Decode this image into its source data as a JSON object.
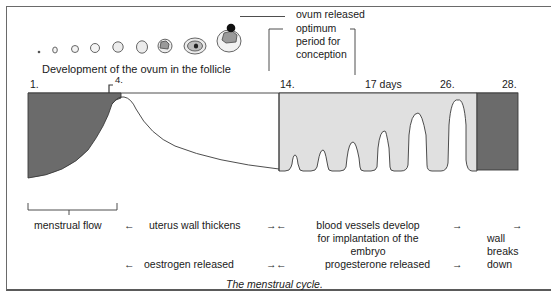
{
  "title": "The menstrual cycle.",
  "top": {
    "follicle_caption": "Development of the ovum in the follicle",
    "ovum_released": "ovum released",
    "conception_period": [
      "optimum",
      "period for",
      "conception"
    ]
  },
  "day_markers": [
    {
      "label": "1.",
      "day": 1
    },
    {
      "label": "4.",
      "day": 4
    },
    {
      "label": "14.",
      "day": 14
    },
    {
      "label": "17 days",
      "day": 17
    },
    {
      "label": "26.",
      "day": 26
    },
    {
      "label": "28.",
      "day": 28
    }
  ],
  "phases": {
    "menstrual_flow": "menstrual flow",
    "uterus_wall": "uterus wall thickens",
    "blood_vessels": [
      "blood vessels develop",
      "for implantation of the",
      "embryo"
    ],
    "wall_breaks": [
      "wall",
      "breaks",
      "down"
    ],
    "oestrogen": "oestrogen released",
    "progesterone": "progesterone released"
  },
  "arrows": {
    "left": "←",
    "right": "→"
  },
  "colors": {
    "dark_fill": "#6b6b6b",
    "light_fill": "#e0e0e0",
    "line": "#3a3a3a",
    "frame": "#6a6a6a"
  }
}
